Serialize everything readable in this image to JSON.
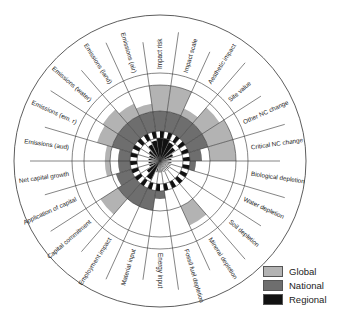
{
  "colors": {
    "global": "#b3b3b3",
    "national": "#6e6e6e",
    "regional": "#111111",
    "line": "#333333"
  },
  "legend": [
    {
      "label": "Global",
      "color": "#b3b3b3"
    },
    {
      "label": "National",
      "color": "#6e6e6e"
    },
    {
      "label": "Regional",
      "color": "#111111"
    }
  ],
  "chart_data": {
    "type": "radial-bar",
    "title": "",
    "rings": [
      "Regional",
      "National",
      "Global"
    ],
    "categories": [
      "Emissions (aud)",
      "Emissions (em. r)",
      "Emissions (water)",
      "Emissions (land)",
      "Emissions (air)",
      "Impact risk",
      "Impact scale",
      "Aesthetic impact",
      "Site value",
      "Other NC change",
      "Critical NC change",
      "Biological depletion",
      "Water depletion",
      "Soil depletion",
      "Mineral depletion",
      "Fossil fuel depletion",
      "Energy input",
      "Material input",
      "Employment impact",
      "Capital commitment",
      "Application of capital",
      "Net capital growth"
    ],
    "series": [
      {
        "name": "Regional",
        "values": [
          0.4,
          0.5,
          0.6,
          0.8,
          0.9,
          1.0,
          1.0,
          0.9,
          0.8,
          0.6,
          0.4,
          0.3,
          0.2,
          0.2,
          0.2,
          0.2,
          0.3,
          0.3,
          0.9,
          0.7,
          0.5,
          0.4
        ]
      },
      {
        "name": "National",
        "values": [
          0.6,
          1.0,
          1.0,
          1.0,
          1.0,
          1.0,
          1.0,
          1.0,
          1.0,
          1.0,
          0.6,
          0.3,
          0.0,
          0.0,
          0.0,
          0.0,
          0.4,
          1.0,
          1.0,
          1.0,
          0.8,
          0.6
        ]
      },
      {
        "name": "Global",
        "values": [
          0.2,
          0.6,
          0.7,
          0.5,
          0.3,
          1.0,
          1.0,
          0.3,
          0.8,
          1.0,
          1.0,
          0.0,
          0.0,
          0.0,
          0.8,
          0.0,
          0.0,
          0.0,
          0.0,
          0.8,
          0.0,
          0.2
        ]
      }
    ]
  }
}
